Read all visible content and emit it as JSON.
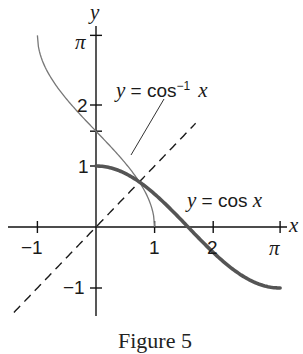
{
  "chart_data": {
    "type": "line",
    "title": "",
    "caption": "Figure 5",
    "xlabel": "x",
    "ylabel": "y",
    "xlim": [
      -1.35,
      3.35
    ],
    "ylim": [
      -1.5,
      3.3
    ],
    "grid": false,
    "x_ticks": [
      {
        "value": -1,
        "label": "−1"
      },
      {
        "value": 1,
        "label": "1"
      },
      {
        "value": 2,
        "label": "2"
      },
      {
        "value": 3.14159,
        "label": "π"
      }
    ],
    "y_ticks": [
      {
        "value": -1,
        "label": "−1"
      },
      {
        "value": 1,
        "label": "1"
      },
      {
        "value": 1.5708,
        "label": ""
      },
      {
        "value": 2,
        "label": "2"
      },
      {
        "value": 3.14159,
        "label": "π"
      }
    ],
    "series": [
      {
        "name": "y = cos x",
        "style": "thick",
        "color": "#555555",
        "domain": [
          0,
          3.14159
        ],
        "function": "cos"
      },
      {
        "name": "y = cos⁻¹ x",
        "style": "thin",
        "color": "#777777",
        "domain": [
          -1,
          1
        ],
        "function": "acos"
      },
      {
        "name": "y = x",
        "style": "dashed",
        "color": "#222222",
        "domain": [
          -1.4,
          1.7
        ],
        "function": "identity"
      }
    ],
    "annotations": [
      {
        "text_parts": [
          "y",
          " = cos",
          "−1",
          " x"
        ],
        "label": "y = cos⁻¹ x",
        "points_to": [
          0.6,
          1.18
        ]
      },
      {
        "text_parts": [
          "y",
          " = cos ",
          "x"
        ],
        "label": "y = cos x"
      },
      {
        "label": "intersection",
        "x": 0.739,
        "y": 0.739
      }
    ]
  },
  "labels": {
    "y_axis": "y",
    "x_axis": "x",
    "pi_y": "π",
    "two_y": "2",
    "one_y": "1",
    "neg_one_y": "−1",
    "neg_one_x": "−1",
    "one_x": "1",
    "two_x": "2",
    "pi_x": "π",
    "acos_y": "y",
    "acos_eq": " = cos",
    "acos_sup": "−1",
    "acos_x": "x",
    "cos_y": "y",
    "cos_eq": " = cos ",
    "cos_x": "x",
    "caption": "Figure 5"
  }
}
